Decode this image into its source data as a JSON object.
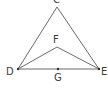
{
  "diagram": {
    "type": "geometry",
    "points": {
      "C": {
        "label": "C",
        "x": 57,
        "y": 7
      },
      "D": {
        "label": "D",
        "x": 18,
        "y": 69
      },
      "E": {
        "label": "E",
        "x": 99,
        "y": 69
      },
      "F": {
        "label": "F",
        "x": 57,
        "y": 47
      },
      "G": {
        "label": "G",
        "x": 58,
        "y": 69
      }
    },
    "segments": [
      "CD",
      "CE",
      "DE",
      "DF",
      "FE"
    ],
    "line_color": "#6a6a6a",
    "label_color": "#3a3a3a"
  }
}
